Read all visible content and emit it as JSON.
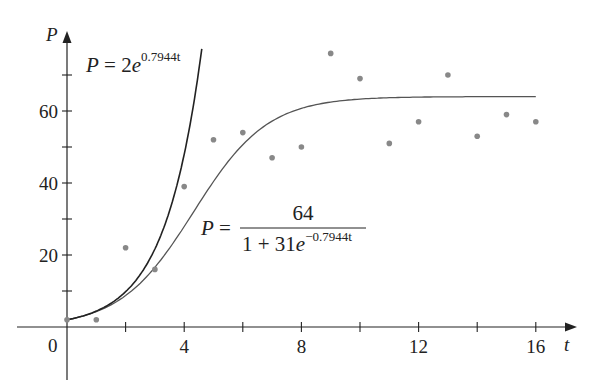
{
  "chart_data": {
    "type": "scatter",
    "title": "",
    "xlabel": "t",
    "ylabel": "P",
    "xlim": [
      0,
      17
    ],
    "ylim": [
      0,
      78
    ],
    "x_ticks_labeled": [
      0,
      4,
      8,
      12,
      16
    ],
    "x_ticks_minor": [
      2,
      6,
      10,
      14
    ],
    "y_ticks_labeled": [
      20,
      40,
      60
    ],
    "y_ticks_minor": [
      10,
      30,
      50,
      70
    ],
    "grid": false,
    "series": [
      {
        "name": "observed",
        "kind": "points",
        "x": [
          0,
          1,
          2,
          3,
          4,
          5,
          6,
          7,
          8,
          9,
          10,
          11,
          12,
          13,
          14,
          15,
          16
        ],
        "values": [
          2,
          2,
          22,
          16,
          39,
          52,
          54,
          47,
          50,
          76,
          69,
          51,
          57,
          70,
          53,
          59,
          57
        ],
        "color": "#888888"
      },
      {
        "name": "exponential model",
        "kind": "curve",
        "formula": "P = 2e^{0.7944t}",
        "a": 2,
        "k": 0.7944,
        "t_range": [
          0,
          4.6
        ],
        "color": "#222222"
      },
      {
        "name": "logistic model",
        "kind": "curve",
        "formula": "P = 64 / (1 + 31e^{-0.7944t})",
        "M": 64,
        "A": 31,
        "k": 0.7944,
        "t_range": [
          0,
          16
        ],
        "color": "#555555"
      }
    ],
    "annotations": [
      {
        "text": "P = 2e^{0.7944t}",
        "near": "exponential curve, top"
      },
      {
        "text": "P = 64 / (1 + 31e^{-0.7944t})",
        "near": "logistic curve, middle"
      }
    ]
  },
  "labels": {
    "x_axis": "t",
    "y_axis": "P",
    "origin": "0",
    "x_ticks": [
      "4",
      "8",
      "12",
      "16"
    ],
    "y_ticks": [
      "20",
      "40",
      "60"
    ],
    "exp_formula": {
      "lhs": "P",
      "eq": " = 2",
      "base": "e",
      "exponent": "0.7944t"
    },
    "log_formula": {
      "lhs": "P",
      "eq": " = ",
      "numerator": "64",
      "denom_prefix": "1 + 31",
      "base": "e",
      "exponent": "−0.7944t"
    }
  }
}
